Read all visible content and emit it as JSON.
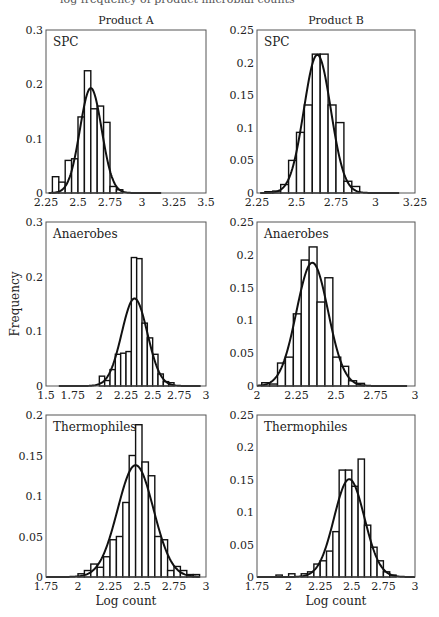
{
  "figure": {
    "column_titles": [
      "Product A",
      "Product B"
    ],
    "shared_ylabel": "Frequency",
    "shared_xlabel": "Log count",
    "top_cut_text": "log frequency of product microbial counts"
  },
  "chart_data": [
    {
      "type": "bar",
      "panel": "Product A - SPC",
      "title": "Product A",
      "label": "SPC",
      "xlim": [
        2.25,
        3.5
      ],
      "ylim": [
        0,
        0.3
      ],
      "xticks": [
        2.25,
        2.5,
        2.75,
        3,
        3.25,
        3.5
      ],
      "xtick_labels": [
        "2.25",
        "2.5",
        "2.75",
        "3",
        "3.25",
        "3.5"
      ],
      "yticks": [
        0,
        0.1,
        0.2,
        0.3
      ],
      "ytick_labels": [
        "0",
        "0.1",
        "0.2",
        "0.3"
      ],
      "bin_width": 0.05,
      "bin_starts": [
        2.3,
        2.35,
        2.4,
        2.45,
        2.5,
        2.55,
        2.6,
        2.65,
        2.7,
        2.75,
        2.8
      ],
      "values": [
        0.03,
        0.02,
        0.06,
        0.063,
        0.14,
        0.225,
        0.155,
        0.16,
        0.13,
        0.012,
        0.006
      ],
      "fit": {
        "type": "normal",
        "mean": 2.6,
        "peak": 0.193,
        "sd": 0.085,
        "x_from": 2.27,
        "x_to": 3.15
      },
      "grid": false,
      "xlabel": "",
      "ylabel": ""
    },
    {
      "type": "bar",
      "panel": "Product B - SPC",
      "title": "Product B",
      "label": "SPC",
      "xlim": [
        2.25,
        3.25
      ],
      "ylim": [
        0,
        0.25
      ],
      "xticks": [
        2.25,
        2.5,
        2.75,
        3,
        3.25
      ],
      "xtick_labels": [
        "2.25",
        "2.5",
        "2.75",
        "3",
        "3.25"
      ],
      "yticks": [
        0,
        0.05,
        0.1,
        0.15,
        0.2,
        0.25
      ],
      "ytick_labels": [
        "0",
        "0.05",
        "0.1",
        "0.15",
        "0.2",
        "0.25"
      ],
      "bin_width": 0.05,
      "bin_starts": [
        2.3,
        2.35,
        2.4,
        2.45,
        2.5,
        2.55,
        2.6,
        2.65,
        2.7,
        2.75,
        2.8,
        2.85
      ],
      "values": [
        0.002,
        0.003,
        0.013,
        0.05,
        0.093,
        0.135,
        0.213,
        0.213,
        0.135,
        0.108,
        0.018,
        0.01
      ],
      "fit": {
        "type": "normal",
        "mean": 2.632,
        "peak": 0.212,
        "sd": 0.085,
        "x_from": 2.27,
        "x_to": 3.15
      },
      "grid": false,
      "xlabel": "",
      "ylabel": ""
    },
    {
      "type": "bar",
      "panel": "Product A - Anaerobes",
      "label": "Anaerobes",
      "xlim": [
        1.5,
        3
      ],
      "ylim": [
        0,
        0.3
      ],
      "xticks": [
        1.5,
        1.75,
        2,
        2.25,
        2.5,
        2.75,
        3
      ],
      "xtick_labels": [
        "1.5",
        "1.75",
        "2",
        "2.25",
        "2.5",
        "2.75",
        "3"
      ],
      "yticks": [
        0,
        0.1,
        0.2,
        0.3
      ],
      "ytick_labels": [
        "0",
        "0.1",
        "0.2",
        "0.3"
      ],
      "bin_width": 0.05,
      "bin_starts": [
        2.0,
        2.05,
        2.1,
        2.15,
        2.2,
        2.25,
        2.3,
        2.35,
        2.4,
        2.45,
        2.5,
        2.55,
        2.6,
        2.65
      ],
      "values": [
        0.018,
        0.01,
        0.03,
        0.058,
        0.06,
        0.063,
        0.235,
        0.233,
        0.115,
        0.088,
        0.058,
        0.022,
        0.008,
        0.006
      ],
      "fit": {
        "type": "normal",
        "mean": 2.33,
        "peak": 0.16,
        "sd": 0.12,
        "x_from": 1.62,
        "x_to": 2.95
      },
      "grid": false,
      "xlabel": "",
      "ylabel": "Frequency"
    },
    {
      "type": "bar",
      "panel": "Product B - Anaerobes",
      "label": "Anaerobes",
      "xlim": [
        2,
        3
      ],
      "ylim": [
        0,
        0.25
      ],
      "xticks": [
        2,
        2.25,
        2.5,
        2.75,
        3
      ],
      "xtick_labels": [
        "2",
        "2.25",
        "2.5",
        "2.75",
        "3"
      ],
      "yticks": [
        0,
        0.05,
        0.1,
        0.15,
        0.2,
        0.25
      ],
      "ytick_labels": [
        "0",
        "0.05",
        "0.1",
        "0.15",
        "0.2",
        "0.25"
      ],
      "bin_width": 0.05,
      "bin_starts": [
        2.03,
        2.08,
        2.13,
        2.18,
        2.23,
        2.28,
        2.33,
        2.38,
        2.43,
        2.48,
        2.53,
        2.58,
        2.63
      ],
      "values": [
        0.005,
        0.003,
        0.035,
        0.044,
        0.11,
        0.192,
        0.212,
        0.128,
        0.165,
        0.044,
        0.03,
        0.008,
        0.004
      ],
      "fit": {
        "type": "normal",
        "mean": 2.35,
        "peak": 0.188,
        "sd": 0.1,
        "x_from": 2.0,
        "x_to": 2.95
      },
      "grid": false,
      "xlabel": "",
      "ylabel": ""
    },
    {
      "type": "bar",
      "panel": "Product A - Thermophiles",
      "label": "Thermophiles",
      "xlim": [
        1.75,
        3
      ],
      "ylim": [
        0,
        0.2
      ],
      "xticks": [
        1.75,
        2,
        2.25,
        2.5,
        2.75,
        3
      ],
      "xtick_labels": [
        "1.75",
        "2",
        "2.25",
        "2.5",
        "2.75",
        "3"
      ],
      "yticks": [
        0,
        0.05,
        0.1,
        0.15,
        0.2
      ],
      "ytick_labels": [
        "0",
        "0.05",
        "0.1",
        "0.15",
        "0.2"
      ],
      "bin_width": 0.05,
      "bin_starts": [
        2.0,
        2.05,
        2.1,
        2.15,
        2.2,
        2.25,
        2.3,
        2.35,
        2.4,
        2.45,
        2.5,
        2.55,
        2.6,
        2.65,
        2.7,
        2.75,
        2.8,
        2.85,
        2.9
      ],
      "values": [
        0.004,
        0.008,
        0.016,
        0.012,
        0.025,
        0.046,
        0.05,
        0.092,
        0.15,
        0.188,
        0.142,
        0.125,
        0.05,
        0.046,
        0.008,
        0.013,
        0.008,
        0.003,
        0.003
      ],
      "fit": {
        "type": "normal",
        "mean": 2.45,
        "peak": 0.138,
        "sd": 0.14,
        "x_from": 1.75,
        "x_to": 2.95
      },
      "grid": false,
      "xlabel": "Log count",
      "ylabel": ""
    },
    {
      "type": "bar",
      "panel": "Product B - Thermophiles",
      "label": "Thermophiles",
      "xlim": [
        1.75,
        3
      ],
      "ylim": [
        0,
        0.25
      ],
      "xticks": [
        1.75,
        2,
        2.25,
        2.5,
        2.75,
        3
      ],
      "xtick_labels": [
        "1.75",
        "2",
        "2.25",
        "2.5",
        "2.75",
        "3"
      ],
      "yticks": [
        0,
        0.05,
        0.1,
        0.15,
        0.2,
        0.25
      ],
      "ytick_labels": [
        "0",
        "0.05",
        "0.1",
        "0.15",
        "0.2",
        "0.25"
      ],
      "bin_width": 0.05,
      "bin_starts": [
        1.9,
        1.95,
        2.0,
        2.05,
        2.1,
        2.15,
        2.2,
        2.25,
        2.3,
        2.35,
        2.4,
        2.45,
        2.5,
        2.55,
        2.6,
        2.65,
        2.7,
        2.75,
        2.8
      ],
      "values": [
        0.003,
        0,
        0.005,
        0,
        0.005,
        0.008,
        0.02,
        0.025,
        0.04,
        0.07,
        0.165,
        0.165,
        0.14,
        0.182,
        0.08,
        0.046,
        0.025,
        0.008,
        0.003
      ],
      "fit": {
        "type": "normal",
        "mean": 2.48,
        "peak": 0.151,
        "sd": 0.12,
        "x_from": 1.75,
        "x_to": 3.0
      },
      "grid": false,
      "xlabel": "Log count",
      "ylabel": ""
    }
  ]
}
